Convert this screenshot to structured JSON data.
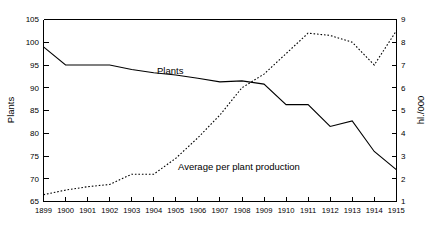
{
  "chart_data": {
    "type": "line",
    "title": "",
    "subtitle": "",
    "xlabel": "",
    "ylabel": "Plants",
    "y2label": "hl./000",
    "grid": false,
    "legend_position": "inline-annotation",
    "background_color": "#ffffff",
    "line_color": "#000000",
    "x": [
      1899,
      1900,
      1901,
      1902,
      1903,
      1904,
      1905,
      1906,
      1907,
      1908,
      1909,
      1910,
      1911,
      1912,
      1913,
      1914,
      1915
    ],
    "categories": [
      "1899",
      "1900",
      "1901",
      "1902",
      "1903",
      "1904",
      "1905",
      "1906",
      "1907",
      "1908",
      "1909",
      "1910",
      "1911",
      "1912",
      "1913",
      "1914",
      "1915"
    ],
    "ylim": [
      65,
      105
    ],
    "yticks": [
      65,
      70,
      75,
      80,
      85,
      90,
      95,
      100,
      105
    ],
    "ytick_labels": [
      "65",
      "70",
      "75",
      "80",
      "85",
      "90",
      "95",
      "100",
      "105"
    ],
    "y2lim": [
      1,
      9
    ],
    "y2ticks": [
      1,
      2,
      3,
      4,
      5,
      6,
      7,
      8,
      9
    ],
    "y2tick_labels": [
      "1",
      "2",
      "3",
      "4",
      "5",
      "6",
      "7",
      "8",
      "9"
    ],
    "series": [
      {
        "name": "Plants",
        "axis": "left",
        "style": "solid",
        "annotation": "Plants",
        "values": [
          99.0,
          95.0,
          95.0,
          95.0,
          94.0,
          93.3,
          92.8,
          92.1,
          91.3,
          91.5,
          90.8,
          86.3,
          86.3,
          81.5,
          82.7,
          76.0,
          72.0
        ]
      },
      {
        "name": "Average per plant production",
        "axis": "right",
        "style": "dotted",
        "annotation": "Average per plant production",
        "values": [
          1.3,
          1.5,
          1.65,
          1.75,
          2.2,
          2.2,
          2.9,
          3.8,
          4.8,
          6.0,
          6.6,
          7.5,
          8.4,
          8.3,
          8.0,
          7.0,
          8.5
        ]
      }
    ]
  },
  "annotations": {
    "plants_label": "Plants",
    "production_label": "Average per plant production"
  },
  "axes": {
    "left_title": "Plants",
    "right_title": "hl./000"
  }
}
